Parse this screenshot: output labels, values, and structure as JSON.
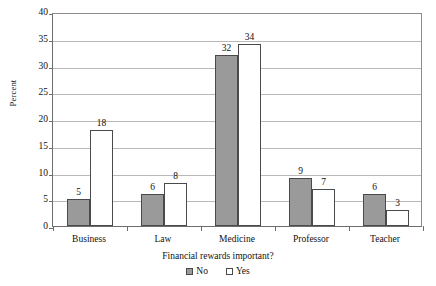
{
  "chart_data": {
    "type": "bar",
    "title": "",
    "subtitle": "",
    "xlabel": "Financial rewards important?",
    "ylabel": "Percent",
    "categories": [
      "Business",
      "Law",
      "Medicine",
      "Professor",
      "Teacher"
    ],
    "series": [
      {
        "name": "No",
        "values": [
          5,
          6,
          32,
          9,
          6
        ],
        "color": "#9a9a9a"
      },
      {
        "name": "Yes",
        "values": [
          18,
          8,
          34,
          7,
          3
        ],
        "color": "#ffffff"
      }
    ],
    "ylim": [
      0,
      40
    ],
    "yticks": [
      0,
      5,
      10,
      15,
      20,
      25,
      30,
      35,
      40
    ],
    "ytick_labels": [
      "0",
      "5",
      "10",
      "15",
      "20",
      "25",
      "30",
      "35",
      "40"
    ],
    "grid": "horizontal",
    "data_labels": true,
    "legend_position": "bottom"
  },
  "legend": {
    "items": [
      {
        "label": "No",
        "swatch": "filled-gray-square"
      },
      {
        "label": "Yes",
        "swatch": "open-white-square"
      }
    ]
  }
}
